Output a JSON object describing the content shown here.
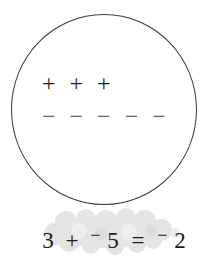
{
  "diagram": {
    "plus_signs": [
      "+",
      "+",
      "+"
    ],
    "minus_signs": [
      "−",
      "−",
      "−",
      "−",
      "−"
    ]
  },
  "equation": {
    "addend1": "3",
    "plus_operator": "+",
    "negative_sign_1": "−",
    "addend2": "5",
    "equals_sign": "=",
    "negative_sign_2": "−",
    "result": "2"
  },
  "colors": {
    "background": "#ffffff",
    "circle_stroke": "#3a3a3a",
    "symbol_color": "#1c1c1c",
    "minus_color": "#444444",
    "cloud_fill": "#e4e4e4"
  }
}
